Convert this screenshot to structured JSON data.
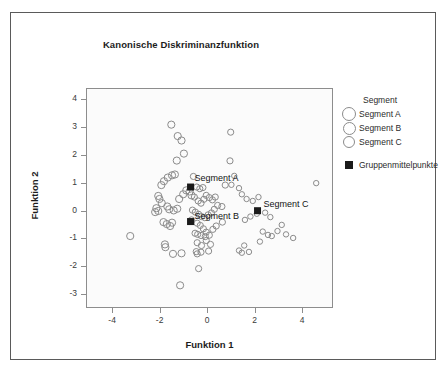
{
  "chart_data": {
    "type": "scatter",
    "title": "Kanonische Diskriminanzfunktion",
    "xlabel": "Funktion 1",
    "ylabel": "Funktion 2",
    "xlim": [
      -5.1,
      5.3
    ],
    "ylim": [
      -3.5,
      4.4
    ],
    "xticks": [
      -4,
      -2,
      0,
      2,
      4
    ],
    "yticks": [
      -3,
      -2,
      -1,
      0,
      1,
      2,
      3,
      4
    ],
    "grid": false,
    "legend_position": "right",
    "legend_title": "Segment",
    "series": [
      {
        "name": "Segment A",
        "marker": "open-circle",
        "points": [
          [
            -1.55,
            3.12
          ],
          [
            -1.28,
            2.71
          ],
          [
            -1.12,
            2.55
          ],
          [
            -1.02,
            2.08
          ],
          [
            -1.32,
            1.83
          ],
          [
            -1.52,
            1.3
          ],
          [
            -1.7,
            1.22
          ],
          [
            -1.4,
            1.33
          ],
          [
            -1.86,
            1.09
          ],
          [
            -1.97,
            0.95
          ],
          [
            -2.1,
            0.56
          ],
          [
            -2.05,
            0.45
          ],
          [
            -1.95,
            0.3
          ],
          [
            -2.18,
            0.12
          ],
          [
            -2.1,
            0.02
          ],
          [
            -2.23,
            -0.02
          ],
          [
            -1.72,
            0.18
          ],
          [
            -1.64,
            0.08
          ],
          [
            -1.45,
            0.04
          ],
          [
            -1.3,
            0.1
          ],
          [
            -1.22,
            0.45
          ],
          [
            -1.05,
            0.62
          ],
          [
            -0.92,
            0.76
          ],
          [
            -0.78,
            0.72
          ],
          [
            -0.7,
            0.58
          ],
          [
            -1.88,
            -0.38
          ],
          [
            -1.74,
            -0.45
          ],
          [
            -1.6,
            -0.52
          ],
          [
            -1.52,
            -0.4
          ],
          [
            -3.28,
            -0.88
          ],
          [
            -1.82,
            -1.18
          ],
          [
            -1.8,
            -1.28
          ],
          [
            -1.48,
            -1.52
          ],
          [
            -1.12,
            -1.5
          ],
          [
            -1.18,
            -2.65
          ]
        ]
      },
      {
        "name": "Segment B",
        "marker": "open-circle",
        "points": [
          [
            -0.62,
            1.26
          ],
          [
            -0.48,
            0.88
          ],
          [
            -0.35,
            0.82
          ],
          [
            -0.22,
            0.86
          ],
          [
            -0.58,
            0.52
          ],
          [
            -0.42,
            0.38
          ],
          [
            -0.3,
            0.3
          ],
          [
            -0.18,
            0.44
          ],
          [
            -0.08,
            0.58
          ],
          [
            0.05,
            0.5
          ],
          [
            0.18,
            0.42
          ],
          [
            0.3,
            0.52
          ],
          [
            -0.66,
            0.05
          ],
          [
            -0.54,
            -0.02
          ],
          [
            -0.4,
            -0.1
          ],
          [
            -0.28,
            -0.18
          ],
          [
            -0.14,
            -0.22
          ],
          [
            0.0,
            -0.12
          ],
          [
            0.14,
            -0.05
          ],
          [
            0.26,
            0.08
          ],
          [
            0.4,
            0.22
          ],
          [
            -0.7,
            -0.3
          ],
          [
            -0.46,
            -0.42
          ],
          [
            -0.33,
            -0.5
          ],
          [
            -0.2,
            -0.62
          ],
          [
            -0.08,
            -0.74
          ],
          [
            -0.3,
            -0.86
          ],
          [
            -0.44,
            -0.82
          ],
          [
            -0.55,
            -0.78
          ],
          [
            -0.12,
            -0.9
          ],
          [
            0.05,
            -0.85
          ],
          [
            0.2,
            -0.64
          ],
          [
            0.34,
            -0.52
          ],
          [
            -0.46,
            -1.12
          ],
          [
            -0.28,
            -1.22
          ],
          [
            -0.08,
            -1.04
          ],
          [
            0.1,
            -1.18
          ],
          [
            -0.5,
            -1.44
          ],
          [
            -0.46,
            -1.52
          ],
          [
            -0.3,
            -1.46
          ],
          [
            0.02,
            -1.42
          ],
          [
            -0.4,
            -2.05
          ],
          [
            0.6,
            -0.38
          ],
          [
            0.72,
            0.95
          ],
          [
            0.95,
            2.85
          ],
          [
            0.92,
            1.82
          ],
          [
            0.58,
            0.18
          ]
        ]
      },
      {
        "name": "Segment C",
        "marker": "open-circle",
        "points": [
          [
            1.1,
            1.28
          ],
          [
            1.3,
            0.84
          ],
          [
            1.42,
            0.62
          ],
          [
            1.62,
            0.45
          ],
          [
            1.88,
            0.38
          ],
          [
            2.12,
            0.52
          ],
          [
            1.55,
            -0.3
          ],
          [
            1.78,
            -0.18
          ],
          [
            2.05,
            -0.08
          ],
          [
            2.4,
            -0.04
          ],
          [
            2.62,
            -0.2
          ],
          [
            2.3,
            -0.72
          ],
          [
            2.52,
            -0.84
          ],
          [
            2.68,
            -0.88
          ],
          [
            2.92,
            -0.7
          ],
          [
            3.28,
            -0.82
          ],
          [
            3.1,
            -0.48
          ],
          [
            3.58,
            -0.95
          ],
          [
            4.55,
            1.02
          ],
          [
            1.52,
            -1.22
          ],
          [
            1.72,
            -1.45
          ],
          [
            1.42,
            -1.48
          ],
          [
            1.3,
            -1.4
          ],
          [
            2.18,
            -1.08
          ],
          [
            0.98,
            0.96
          ]
        ]
      }
    ],
    "centroids": [
      {
        "label": "Segment A",
        "x": -0.74,
        "y": 0.88
      },
      {
        "label": "Segment B",
        "x": -0.74,
        "y": -0.36
      },
      {
        "label": "Segment C",
        "x": 2.08,
        "y": 0.03
      }
    ]
  },
  "legend": {
    "title": "Segment",
    "items": [
      {
        "label": "Segment A",
        "marker": "open-circle",
        "size": 12
      },
      {
        "label": "Segment B",
        "marker": "open-circle",
        "size": 11
      },
      {
        "label": "Segment C",
        "marker": "open-circle",
        "size": 10
      }
    ],
    "centroid_item": {
      "label": "Gruppenmittelpunkte",
      "marker": "filled-square"
    }
  },
  "colors": {
    "marker_stroke": "#8b8b8b",
    "centroid_fill": "#1a1a1a",
    "frame": "#8d8d8d",
    "outer_border": "#5a5a5a",
    "plot_background": "#fbfbfb",
    "text": "#2b2b2b"
  }
}
